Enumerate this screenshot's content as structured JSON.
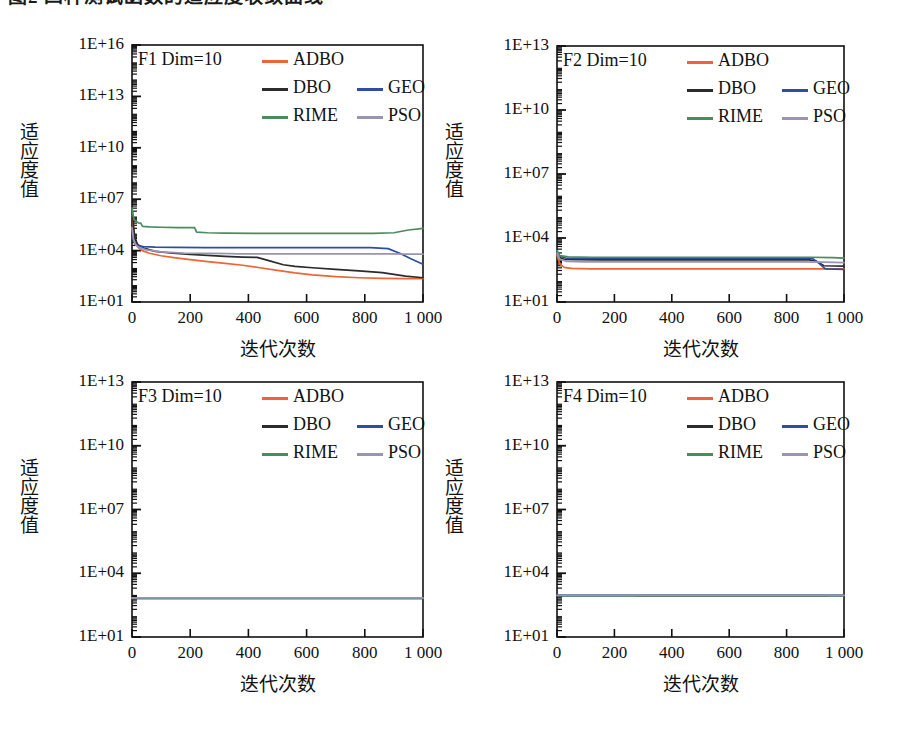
{
  "page": {
    "cut_off_header_text": "图2 四种测试函数的适应度收敛曲线"
  },
  "axis": {
    "xlabel": "迭代次数",
    "ylabel": "适应度值",
    "xticks": [
      "0",
      "200",
      "400",
      "600",
      "800",
      "1 000"
    ],
    "xtick_values": [
      0,
      200,
      400,
      600,
      800,
      1000
    ],
    "yticks_16": [
      "1E+01",
      "1E+04",
      "1E+07",
      "1E+10",
      "1E+13",
      "1E+16"
    ],
    "yticks_13": [
      "1E+01",
      "1E+04",
      "1E+07",
      "1E+10",
      "1E+13"
    ]
  },
  "legend": {
    "entries": [
      {
        "label": "ADBO",
        "color": "#ee6533"
      },
      {
        "label": "DBO",
        "color": "#2b2b2b"
      },
      {
        "label": "GEO",
        "color": "#2d4f9e"
      },
      {
        "label": "RIME",
        "color": "#4a8c5c"
      },
      {
        "label": "PSO",
        "color": "#9a93b5"
      }
    ]
  },
  "colors": {
    "ADBO": "#ee6533",
    "DBO": "#2b2b2b",
    "GEO": "#2d4f9e",
    "RIME": "#4a8c5c",
    "PSO": "#9a93b5",
    "axis": "#111111",
    "background": "#ffffff"
  },
  "chart_data": [
    {
      "type": "line",
      "panel": "F1",
      "title": "F1 Dim=10",
      "xlabel": "迭代次数",
      "ylabel": "适应度值",
      "xlim": [
        0,
        1000
      ],
      "ylim": [
        10,
        1e+16
      ],
      "yscale": "log",
      "xticks": [
        0,
        200,
        400,
        600,
        800,
        1000
      ],
      "yticks": [
        10,
        10000,
        10000000.0,
        10000000000.0,
        10000000000000.0,
        1e+16
      ],
      "grid": false,
      "legend_position": "top-left-inside",
      "series": [
        {
          "name": "ADBO",
          "color": "#ee6533",
          "x": [
            0,
            5,
            10,
            20,
            35,
            60,
            100,
            150,
            200,
            260,
            320,
            380,
            440,
            500,
            560,
            620,
            700,
            780,
            860,
            940,
            1000
          ],
          "y": [
            3000000.0,
            200000.0,
            30000.0,
            16000.0,
            10000.0,
            7000.0,
            5000.0,
            3800.0,
            3000.0,
            2300.0,
            1800.0,
            1400.0,
            1000.0,
            700.0,
            500.0,
            380.0,
            300.0,
            260.0,
            240.0,
            230.0,
            230.0
          ]
        },
        {
          "name": "DBO",
          "color": "#2b2b2b",
          "x": [
            0,
            5,
            10,
            20,
            40,
            80,
            140,
            200,
            260,
            320,
            380,
            430,
            470,
            520,
            560,
            620,
            700,
            780,
            860,
            940,
            1000
          ],
          "y": [
            3000000.0,
            300000.0,
            50000.0,
            22000.0,
            14000.0,
            9000.0,
            7000.0,
            6000.0,
            5200.0,
            4600.0,
            4200.0,
            4000.0,
            2600.0,
            1500.0,
            1200.0,
            1000.0,
            800.0,
            650.0,
            520.0,
            320.0,
            260.0
          ]
        },
        {
          "name": "GEO",
          "color": "#2d4f9e",
          "x": [
            0,
            5,
            10,
            20,
            40,
            80,
            150,
            250,
            400,
            550,
            700,
            820,
            880,
            920,
            960,
            1000
          ],
          "y": [
            200000.0,
            40000.0,
            24000.0,
            19000.0,
            17000.0,
            16000.0,
            15500.0,
            15000.0,
            15000.0,
            15000.0,
            15000.0,
            15000.0,
            13000.0,
            7000.0,
            3200.0,
            1600.0
          ]
        },
        {
          "name": "RIME",
          "color": "#4a8c5c",
          "x": [
            0,
            4,
            8,
            14,
            22,
            30,
            36,
            60,
            100,
            160,
            215,
            222,
            260,
            320,
            420,
            560,
            700,
            830,
            900,
            950,
            1000
          ],
          "y": [
            3000000.0,
            1000000.0,
            600000.0,
            500000.0,
            420000.0,
            400000.0,
            260000.0,
            240000.0,
            230000.0,
            220000.0,
            220000.0,
            120000.0,
            110000.0,
            105000.0,
            100000.0,
            100000.0,
            100000.0,
            100000.0,
            110000.0,
            160000.0,
            200000.0
          ]
        },
        {
          "name": "PSO",
          "color": "#9a93b5",
          "x": [
            0,
            5,
            12,
            25,
            50,
            100,
            180,
            260,
            340,
            360,
            420,
            500,
            600,
            700,
            800,
            880,
            940,
            1000
          ],
          "y": [
            220000.0,
            45000.0,
            22000.0,
            15000.0,
            11000.0,
            8500.0,
            7200.0,
            6800.0,
            6600.0,
            6500.0,
            6500.0,
            6500.0,
            6500.0,
            6500.0,
            6500.0,
            6400.0,
            6300.0,
            6200.0
          ]
        }
      ]
    },
    {
      "type": "line",
      "panel": "F2",
      "title": "F2 Dim=10",
      "xlabel": "迭代次数",
      "ylabel": "适应度值",
      "xlim": [
        0,
        1000
      ],
      "ylim": [
        10,
        10000000000000.0
      ],
      "yscale": "log",
      "xticks": [
        0,
        200,
        400,
        600,
        800,
        1000
      ],
      "yticks": [
        10,
        10000,
        10000000.0,
        10000000000.0,
        10000000000000.0
      ],
      "grid": false,
      "legend_position": "top-left-inside",
      "series": [
        {
          "name": "ADBO",
          "color": "#ee6533",
          "x": [
            0,
            10,
            25,
            50,
            120,
            300,
            500,
            700,
            860,
            900,
            940,
            1000
          ],
          "y": [
            1600.0,
            600.0,
            420.0,
            380.0,
            360.0,
            360.0,
            360.0,
            360.0,
            360.0,
            360.0,
            360.0,
            360.0
          ]
        },
        {
          "name": "DBO",
          "color": "#2b2b2b",
          "x": [
            0,
            10,
            25,
            60,
            150,
            350,
            550,
            750,
            880,
            905,
            930,
            1000
          ],
          "y": [
            2200.0,
            1200.0,
            1000.0,
            960.0,
            940.0,
            940.0,
            940.0,
            940.0,
            940.0,
            800.0,
            500.0,
            480.0
          ]
        },
        {
          "name": "GEO",
          "color": "#2d4f9e",
          "x": [
            0,
            10,
            30,
            80,
            200,
            400,
            600,
            800,
            890,
            910,
            935,
            1000
          ],
          "y": [
            2400.0,
            1400.0,
            1150.0,
            1100.0,
            1100.0,
            1100.0,
            1100.0,
            1100.0,
            1100.0,
            700.0,
            360.0,
            340.0
          ]
        },
        {
          "name": "RIME",
          "color": "#4a8c5c",
          "x": [
            0,
            10,
            40,
            120,
            300,
            500,
            700,
            880,
            960,
            1000
          ],
          "y": [
            2600.0,
            1500.0,
            1300.0,
            1250.0,
            1250.0,
            1250.0,
            1250.0,
            1250.0,
            1200.0,
            1150.0
          ]
        },
        {
          "name": "PSO",
          "color": "#9a93b5",
          "x": [
            0,
            10,
            35,
            100,
            250,
            450,
            650,
            850,
            930,
            1000
          ],
          "y": [
            2000.0,
            1000.0,
            800.0,
            760.0,
            760.0,
            760.0,
            760.0,
            760.0,
            740.0,
            700.0
          ]
        }
      ]
    },
    {
      "type": "line",
      "panel": "F3",
      "title": "F3 Dim=10",
      "xlabel": "迭代次数",
      "ylabel": "适应度值",
      "xlim": [
        0,
        1000
      ],
      "ylim": [
        10,
        10000000000000.0
      ],
      "yscale": "log",
      "xticks": [
        0,
        200,
        400,
        600,
        800,
        1000
      ],
      "yticks": [
        10,
        10000,
        10000000.0,
        10000000000.0,
        10000000000000.0
      ],
      "grid": false,
      "legend_position": "top-left-inside",
      "series": [
        {
          "name": "ADBO",
          "color": "#ee6533",
          "x": [
            0,
            250,
            500,
            750,
            1000
          ],
          "y": [
            650.0,
            650.0,
            650.0,
            650.0,
            650.0
          ]
        },
        {
          "name": "DBO",
          "color": "#2b2b2b",
          "x": [
            0,
            250,
            500,
            750,
            1000
          ],
          "y": [
            660.0,
            660.0,
            660.0,
            660.0,
            660.0
          ]
        },
        {
          "name": "GEO",
          "color": "#2d4f9e",
          "x": [
            0,
            250,
            500,
            750,
            1000
          ],
          "y": [
            680.0,
            680.0,
            680.0,
            680.0,
            680.0
          ]
        },
        {
          "name": "RIME",
          "color": "#4a8c5c",
          "x": [
            0,
            250,
            500,
            750,
            1000
          ],
          "y": [
            670.0,
            670.0,
            670.0,
            670.0,
            670.0
          ]
        },
        {
          "name": "PSO",
          "color": "#9a93b5",
          "x": [
            0,
            250,
            500,
            750,
            1000
          ],
          "y": [
            690.0,
            690.0,
            690.0,
            690.0,
            690.0
          ]
        }
      ]
    },
    {
      "type": "line",
      "panel": "F4",
      "title": "F4 Dim=10",
      "xlabel": "迭代次数",
      "ylabel": "适应度值",
      "xlim": [
        0,
        1000
      ],
      "ylim": [
        10,
        10000000000000.0
      ],
      "yscale": "log",
      "xticks": [
        0,
        200,
        400,
        600,
        800,
        1000
      ],
      "yticks": [
        10,
        10000,
        10000000.0,
        10000000000.0,
        10000000000000.0
      ],
      "grid": false,
      "legend_position": "top-left-inside",
      "series": [
        {
          "name": "ADBO",
          "color": "#ee6533",
          "x": [
            280,
            500,
            750,
            940
          ],
          "y": [
            860.0,
            860.0,
            860.0,
            860.0
          ]
        },
        {
          "name": "DBO",
          "color": "#2b2b2b",
          "x": [
            0,
            250,
            500,
            750,
            1000
          ],
          "y": [
            880.0,
            880.0,
            880.0,
            880.0,
            880.0
          ]
        },
        {
          "name": "GEO",
          "color": "#2d4f9e",
          "x": [
            0,
            250,
            500,
            750,
            1000
          ],
          "y": [
            900.0,
            900.0,
            900.0,
            900.0,
            900.0
          ]
        },
        {
          "name": "RIME",
          "color": "#4a8c5c",
          "x": [
            0,
            250,
            500,
            750,
            1000
          ],
          "y": [
            890.0,
            890.0,
            890.0,
            890.0,
            890.0
          ]
        },
        {
          "name": "PSO",
          "color": "#9a93b5",
          "x": [
            0,
            250,
            500,
            750,
            1000
          ],
          "y": [
            910.0,
            910.0,
            910.0,
            910.0,
            910.0
          ]
        }
      ]
    }
  ]
}
